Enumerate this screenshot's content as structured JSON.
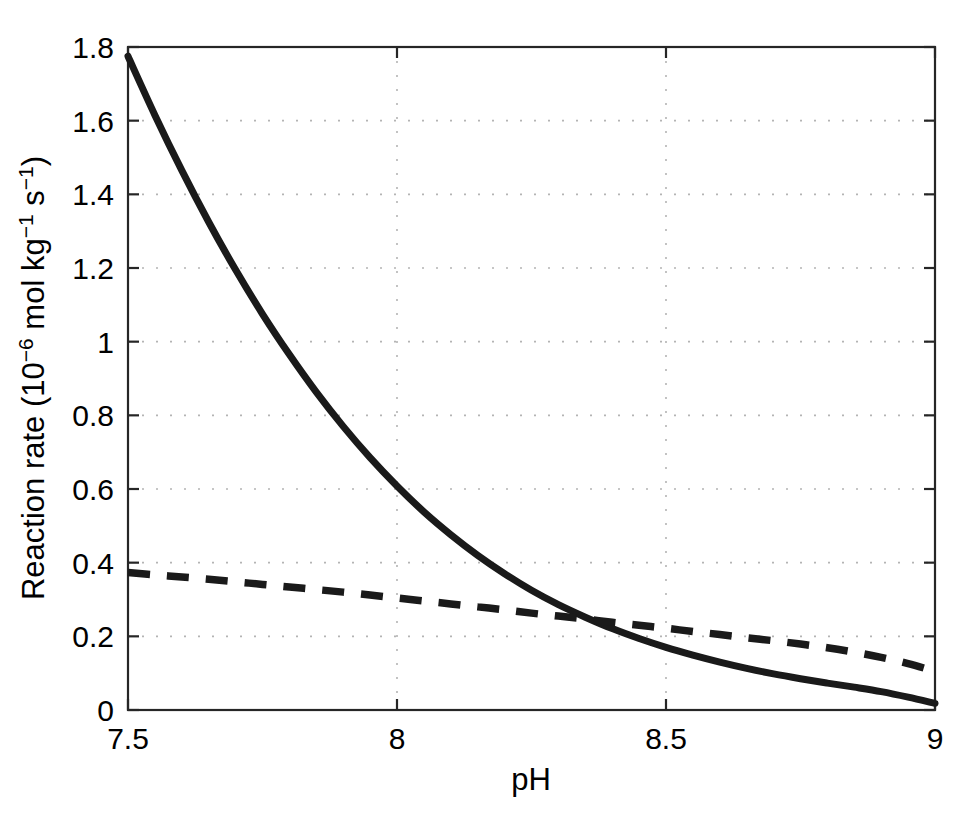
{
  "figure": {
    "background_color": "#ffffff",
    "axes_color": "#262626",
    "grid_color": "#b4b4b4",
    "line_color": "#1a1a1a"
  },
  "axis": {
    "x": {
      "label": "pH",
      "ticks": [
        "7.5",
        "8",
        "8.5",
        "9"
      ],
      "tick_values": [
        7.5,
        8,
        8.5,
        9
      ],
      "min": 7.5,
      "max": 9
    },
    "y": {
      "label_main": "Reaction rate (10",
      "label_exp1": "−6",
      "label_mid": " mol kg",
      "label_exp2": "−1",
      "label_mid2": " s",
      "label_exp3": "−1",
      "label_end": ")",
      "label_plain": "Reaction rate (10−6 mol kg−1 s−1)",
      "ticks": [
        "0",
        "0.2",
        "0.4",
        "0.6",
        "0.8",
        "1",
        "1.2",
        "1.4",
        "1.6",
        "1.8"
      ],
      "tick_values": [
        0,
        0.2,
        0.4,
        0.6,
        0.8,
        1,
        1.2,
        1.4,
        1.6,
        1.8
      ],
      "min": 0,
      "max": 1.8
    }
  },
  "chart_data": {
    "type": "line",
    "title": "",
    "xlabel": "pH",
    "ylabel": "Reaction rate (10−6 mol kg−1 s−1)",
    "xlim": [
      7.5,
      9.0
    ],
    "ylim": [
      0,
      1.8
    ],
    "grid": true,
    "legend": "none",
    "x": [
      7.5,
      7.55,
      7.6,
      7.65,
      7.7,
      7.75,
      7.8,
      7.85,
      7.9,
      7.95,
      8.0,
      8.05,
      8.1,
      8.15,
      8.2,
      8.25,
      8.3,
      8.35,
      8.4,
      8.45,
      8.5,
      8.55,
      8.6,
      8.65,
      8.7,
      8.75,
      8.8,
      8.85,
      8.9,
      8.95,
      9.0
    ],
    "series": [
      {
        "name": "solid-curve",
        "style": "solid",
        "color": "#1a1a1a",
        "values": [
          1.775,
          1.615,
          1.465,
          1.325,
          1.195,
          1.075,
          0.965,
          0.863,
          0.77,
          0.685,
          0.608,
          0.538,
          0.476,
          0.42,
          0.37,
          0.325,
          0.286,
          0.252,
          0.221,
          0.194,
          0.17,
          0.149,
          0.13,
          0.113,
          0.098,
          0.085,
          0.073,
          0.062,
          0.05,
          0.035,
          0.018
        ]
      },
      {
        "name": "dashed-curve",
        "style": "dashed",
        "color": "#1a1a1a",
        "values": [
          0.373,
          0.367,
          0.361,
          0.355,
          0.348,
          0.341,
          0.334,
          0.327,
          0.32,
          0.312,
          0.304,
          0.296,
          0.288,
          0.28,
          0.272,
          0.263,
          0.255,
          0.247,
          0.238,
          0.23,
          0.222,
          0.213,
          0.205,
          0.196,
          0.188,
          0.179,
          0.169,
          0.157,
          0.143,
          0.126,
          0.105
        ]
      }
    ],
    "annotations": [
      {
        "text": "curves cross near pH 8.18 at rate 0.28"
      }
    ]
  }
}
